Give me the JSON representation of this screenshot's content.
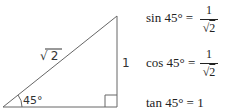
{
  "triangle": {
    "hypotenuse_label": "√2",
    "hyp_radical": "√",
    "hyp_radicand": "2",
    "opposite_label": "1",
    "angle_label": "45°",
    "right_angle": true
  },
  "formulas": [
    {
      "lhs": "sin 45° =",
      "numerator": "1",
      "den_radical": "√",
      "den_radicand": "2"
    },
    {
      "lhs": "cos 45° =",
      "numerator": "1",
      "den_radical": "√",
      "den_radicand": "2"
    },
    {
      "lhs": "tan 45° = 1"
    }
  ],
  "colors": {
    "stroke": "#555555",
    "text": "#222222"
  }
}
